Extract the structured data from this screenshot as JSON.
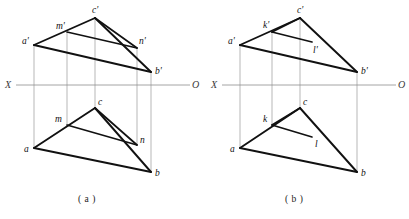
{
  "figure": {
    "axis": {
      "left_label": "X",
      "right_label": "O"
    },
    "colors": {
      "edge": "#111111",
      "projection_line": "#9a9a9a",
      "axis": "#8d8d8d",
      "background": "#ffffff"
    },
    "panels": [
      {
        "id": "a",
        "caption": "( a )",
        "axis_y": 85,
        "axis_x_start": 8,
        "axis_x_end": 196,
        "axis_left_label": "X",
        "axis_right_label": "O",
        "frontal_view": {
          "name": "frontal-projection",
          "vertices": [
            {
              "name": "a-prime",
              "label": "a'",
              "x": 34,
              "y": 45,
              "label_x": 22,
              "label_y": 44
            },
            {
              "name": "c-prime",
              "label": "c'",
              "x": 95,
              "y": 18,
              "label_x": 92,
              "label_y": 13
            },
            {
              "name": "b-prime",
              "label": "b'",
              "x": 151,
              "y": 72,
              "label_x": 155,
              "label_y": 74
            }
          ],
          "line_points": [
            {
              "name": "m-prime",
              "label": "m'",
              "x": 67,
              "y": 32,
              "label_x": 57,
              "label_y": 29
            },
            {
              "name": "n-prime",
              "label": "n'",
              "x": 137,
              "y": 48,
              "label_x": 139,
              "label_y": 44
            }
          ]
        },
        "horizontal_view": {
          "name": "horizontal-projection",
          "vertices": [
            {
              "name": "a",
              "label": "a",
              "x": 34,
              "y": 148,
              "label_x": 24,
              "label_y": 152
            },
            {
              "name": "c",
              "label": "c",
              "x": 95,
              "y": 108,
              "label_x": 98,
              "label_y": 105
            },
            {
              "name": "b",
              "label": "b",
              "x": 151,
              "y": 172,
              "label_x": 155,
              "label_y": 176
            }
          ],
          "line_points": [
            {
              "name": "m",
              "label": "m",
              "x": 67,
              "y": 125,
              "label_x": 56,
              "label_y": 122
            },
            {
              "name": "n",
              "label": "n",
              "x": 137,
              "y": 145,
              "label_x": 140,
              "label_y": 143
            }
          ]
        },
        "projection_lines": [
          {
            "name": "projector-a",
            "x": 34,
            "y_top": 45,
            "y_bottom": 148
          },
          {
            "name": "projector-m",
            "x": 67,
            "y_top": 32,
            "y_bottom": 125
          },
          {
            "name": "projector-c",
            "x": 95,
            "y_top": 18,
            "y_bottom": 108
          },
          {
            "name": "projector-n",
            "x": 137,
            "y_top": 48,
            "y_bottom": 145
          },
          {
            "name": "projector-b",
            "x": 151,
            "y_top": 72,
            "y_bottom": 172
          }
        ]
      },
      {
        "id": "b",
        "caption": "( b )",
        "axis_y": 85,
        "axis_x_start": 214,
        "axis_x_end": 402,
        "axis_left_label": "X",
        "axis_right_label": "O",
        "frontal_view": {
          "name": "frontal-projection",
          "vertices": [
            {
              "name": "a-prime",
              "label": "a'",
              "x": 240,
              "y": 45,
              "label_x": 228,
              "label_y": 44
            },
            {
              "name": "c-prime",
              "label": "c'",
              "x": 300,
              "y": 18,
              "label_x": 297,
              "label_y": 13
            },
            {
              "name": "b-prime",
              "label": "b'",
              "x": 357,
              "y": 72,
              "label_x": 361,
              "label_y": 74
            }
          ],
          "line_points": [
            {
              "name": "k-prime",
              "label": "k'",
              "x": 272,
              "y": 32,
              "label_x": 264,
              "label_y": 28
            },
            {
              "name": "l-prime",
              "label": "l'",
              "x": 312,
              "y": 42,
              "label_x": 313,
              "label_y": 52
            }
          ]
        },
        "horizontal_view": {
          "name": "horizontal-projection",
          "vertices": [
            {
              "name": "a",
              "label": "a",
              "x": 240,
              "y": 148,
              "label_x": 230,
              "label_y": 152
            },
            {
              "name": "c",
              "label": "c",
              "x": 300,
              "y": 108,
              "label_x": 303,
              "label_y": 105
            },
            {
              "name": "b",
              "label": "b",
              "x": 357,
              "y": 172,
              "label_x": 361,
              "label_y": 176
            }
          ],
          "line_points": [
            {
              "name": "k",
              "label": "k",
              "x": 272,
              "y": 125,
              "label_x": 264,
              "label_y": 122
            },
            {
              "name": "l",
              "label": "l",
              "x": 312,
              "y": 137,
              "label_x": 315,
              "label_y": 146
            }
          ]
        },
        "projection_lines": [
          {
            "name": "projector-a",
            "x": 240,
            "y_top": 45,
            "y_bottom": 148
          },
          {
            "name": "projector-k",
            "x": 272,
            "y_top": 32,
            "y_bottom": 125
          },
          {
            "name": "projector-c",
            "x": 300,
            "y_top": 18,
            "y_bottom": 108
          },
          {
            "name": "projector-b",
            "x": 357,
            "y_top": 72,
            "y_bottom": 172
          }
        ]
      }
    ]
  }
}
